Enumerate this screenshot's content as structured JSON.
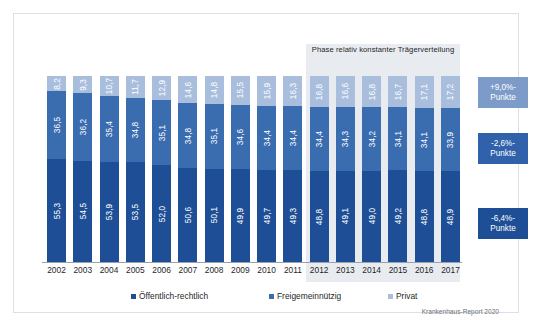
{
  "figure": {
    "phase_annotation": "Phase relativ konstanter Trägerverteilung",
    "source": "Krankenhaus-Report 2020"
  },
  "legend": [
    {
      "label": "Öffentlich-rechtlich",
      "color": "#1e4f96"
    },
    {
      "label": "Freigemeinnützig",
      "color": "#3a6cb0"
    },
    {
      "label": "Privat",
      "color": "#a9bedd"
    }
  ],
  "callouts": [
    {
      "value": "+9,0%-",
      "unit": "Punkte",
      "color": "#7d9bc9"
    },
    {
      "value": "-2,6%-",
      "unit": "Punkte",
      "color": "#2f62ab"
    },
    {
      "value": "-6,4%-",
      "unit": "Punkte",
      "color": "#1e4f96"
    }
  ],
  "chart_data": {
    "type": "bar",
    "stacked": true,
    "stack_total": 100,
    "title": "",
    "xlabel": "",
    "ylabel": "",
    "ylim": [
      0,
      100
    ],
    "grid": false,
    "legend_position": "bottom",
    "categories": [
      "2002",
      "2003",
      "2004",
      "2005",
      "2006",
      "2007",
      "2008",
      "2009",
      "2010",
      "2011",
      "2012",
      "2013",
      "2014",
      "2015",
      "2016",
      "2017"
    ],
    "series": [
      {
        "name": "Öffentlich-rechtlich",
        "color": "#1e4f96",
        "values": [
          55.3,
          54.5,
          53.9,
          53.5,
          52.0,
          50.6,
          50.1,
          49.9,
          49.7,
          49.3,
          48.8,
          49.1,
          49.0,
          49.2,
          48.8,
          48.9
        ],
        "labels": [
          "55,3",
          "54,5",
          "53,9",
          "53,5",
          "52,0",
          "50,6",
          "50,1",
          "49,9",
          "49,7",
          "49,3",
          "48,8",
          "49,1",
          "49,0",
          "49,2",
          "48,8",
          "48,9"
        ],
        "change_label": "-6,4%-Punkte"
      },
      {
        "name": "Freigemeinnützig",
        "color": "#3a6cb0",
        "values": [
          36.5,
          36.2,
          35.4,
          34.8,
          35.1,
          34.8,
          35.1,
          34.6,
          34.4,
          34.4,
          34.4,
          34.3,
          34.2,
          34.1,
          34.1,
          33.9
        ],
        "labels": [
          "36,5",
          "36,2",
          "35,4",
          "34,8",
          "35,1",
          "34,8",
          "35,1",
          "34,6",
          "34,4",
          "34,4",
          "34,4",
          "34,3",
          "34,2",
          "34,1",
          "34,1",
          "33,9"
        ],
        "change_label": "-2,6%-Punkte"
      },
      {
        "name": "Privat",
        "color": "#a9bedd",
        "values": [
          8.2,
          9.3,
          10.7,
          11.7,
          12.9,
          14.6,
          14.8,
          15.5,
          15.9,
          16.3,
          16.8,
          16.6,
          16.8,
          16.7,
          17.1,
          17.2
        ],
        "labels": [
          "8,2",
          "9,3",
          "10,7",
          "11,7",
          "12,9",
          "14,6",
          "14,8",
          "15,5",
          "15,9",
          "16,3",
          "16,8",
          "16,6",
          "16,8",
          "16,7",
          "17,1",
          "17,2"
        ],
        "change_label": "+9,0%-Punkte"
      }
    ],
    "highlight_region": {
      "label": "Phase relativ konstanter Trägerverteilung",
      "from": "2012",
      "to": "2017"
    }
  }
}
